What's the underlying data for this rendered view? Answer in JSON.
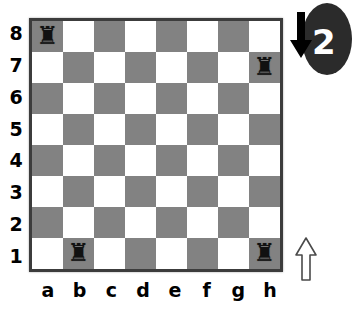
{
  "board": {
    "ranks": [
      "8",
      "7",
      "6",
      "5",
      "4",
      "3",
      "2",
      "1"
    ],
    "files": [
      "a",
      "b",
      "c",
      "d",
      "e",
      "f",
      "g",
      "h"
    ],
    "light_square_color": "#ffffff",
    "dark_square_color": "#828282",
    "border_color": "#3c3c3c",
    "pieces": [
      {
        "square": "a8",
        "glyph": "♜",
        "name": "black-rook"
      },
      {
        "square": "h7",
        "glyph": "♜",
        "name": "black-rook"
      },
      {
        "square": "b1",
        "glyph": "♜",
        "name": "black-rook"
      },
      {
        "square": "h1",
        "glyph": "♜",
        "name": "black-rook"
      }
    ]
  },
  "annotations": {
    "arrow_down": {
      "name": "down-arrow",
      "color": "#000000"
    },
    "arrow_up": {
      "name": "up-arrow",
      "fill": "#ffffff",
      "stroke": "#555555"
    },
    "badge": {
      "number": "2",
      "fill": "#2b2b2b",
      "text_color": "#ffffff"
    }
  }
}
